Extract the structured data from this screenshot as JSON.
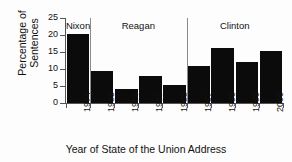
{
  "chart_data": {
    "type": "bar",
    "title": "",
    "xlabel": "Year of State of the Union Address",
    "ylabel_line1": "Percentage of",
    "ylabel_line2": "Sentences",
    "categories": [
      "1974",
      "1985",
      "1986",
      "1987",
      "1988",
      "1997",
      "1998",
      "1999",
      "2000"
    ],
    "values": [
      20.2,
      9.5,
      4.2,
      7.9,
      5.3,
      10.8,
      16.3,
      12.1,
      15.2
    ],
    "ylim": [
      0,
      25
    ],
    "yticks": [
      "0",
      "5",
      "10",
      "15",
      "20",
      "25"
    ],
    "ytick_values": [
      0,
      5,
      10,
      15,
      20,
      25
    ],
    "grid": false,
    "legend": "none",
    "bar_color": "#0b0b0b",
    "axis_color": "#555555",
    "separator_color": "#8a8a8a",
    "groups": [
      {
        "label": "Nixon",
        "categories": [
          "1974"
        ]
      },
      {
        "label": "Reagan",
        "categories": [
          "1985",
          "1986",
          "1987",
          "1988"
        ]
      },
      {
        "label": "Clinton",
        "categories": [
          "1997",
          "1998",
          "1999",
          "2000"
        ]
      }
    ]
  }
}
